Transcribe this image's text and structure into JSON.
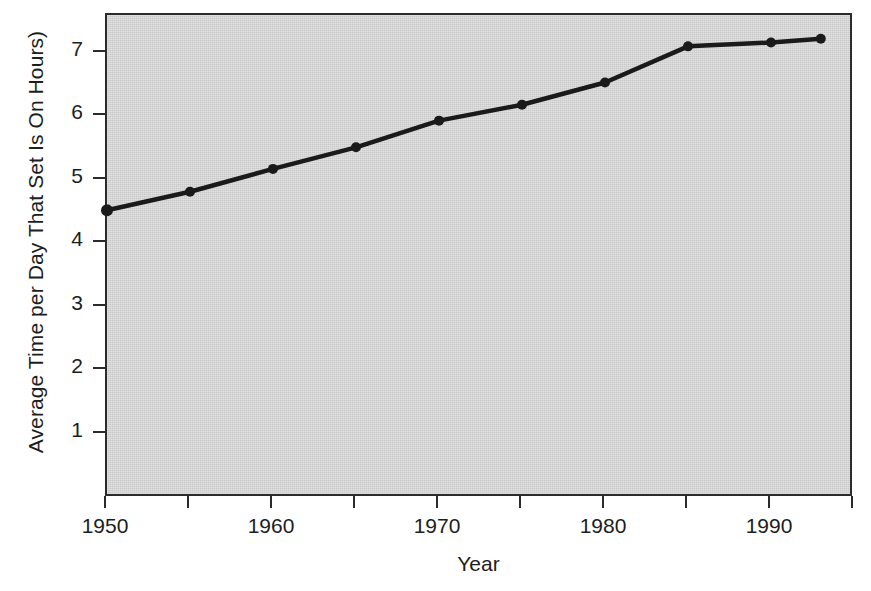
{
  "chart_data": {
    "type": "line",
    "title": "",
    "xlabel": "Year",
    "ylabel": "Average Time per Day That Set Is On Hours)",
    "x": [
      1950,
      1955,
      1960,
      1965,
      1970,
      1975,
      1980,
      1985,
      1990,
      1993
    ],
    "values": [
      4.52,
      4.81,
      5.17,
      5.51,
      5.93,
      6.18,
      6.53,
      7.1,
      7.16,
      7.22
    ],
    "series": [
      {
        "name": "Average hours TV set is on per day",
        "values": [
          4.52,
          4.81,
          5.17,
          5.51,
          5.93,
          6.18,
          6.53,
          7.1,
          7.16,
          7.22
        ]
      }
    ],
    "xlim": [
      1950,
      1995
    ],
    "ylim": [
      0,
      7.6
    ],
    "xticks": [
      1950,
      1955,
      1960,
      1965,
      1970,
      1975,
      1980,
      1985,
      1990,
      1995
    ],
    "xtick_labels": [
      "1950",
      "",
      "1960",
      "",
      "1970",
      "",
      "1980",
      "",
      "1990",
      ""
    ],
    "yticks": [
      1,
      2,
      3,
      4,
      5,
      6,
      7
    ],
    "ytick_labels": [
      "1",
      "2",
      "3",
      "4",
      "5",
      "6",
      "7"
    ],
    "grid": false,
    "legend": "none",
    "plot_background": "#c9c9c9",
    "line_color": "#1a1a1a",
    "marker_color": "#1a1a1a",
    "axis_color": "#2b2b2b"
  }
}
